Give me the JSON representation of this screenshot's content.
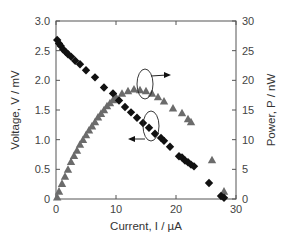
{
  "chart_data": {
    "type": "scatter",
    "title": "",
    "xlabel": "Current, I / µA",
    "ylabel_left": "Voltage, V / mV",
    "ylabel_right": "Power, P / nW",
    "xlim": [
      0,
      30
    ],
    "ylim_left": [
      0,
      3.0
    ],
    "ylim_right": [
      0,
      30
    ],
    "x_ticks": [
      "0",
      "10",
      "20",
      "30"
    ],
    "y_left_ticks": [
      "0",
      "0.5",
      "1.0",
      "1.5",
      "2.0",
      "2.5",
      "3.0"
    ],
    "y_right_ticks": [
      "0",
      "5",
      "10",
      "15",
      "20",
      "25",
      "30"
    ],
    "grid": false,
    "legend": "none (annotated with circles and arrows)",
    "series": [
      {
        "name": "Voltage",
        "axis": "left",
        "marker": "diamond",
        "color": "#111111",
        "x": [
          0.2,
          0.5,
          0.8,
          1.2,
          1.6,
          2.0,
          2.5,
          3.2,
          4.0,
          5.0,
          6.5,
          8.0,
          9.5,
          10.5,
          11.5,
          12.5,
          13.5,
          14.5,
          15.5,
          16.5,
          17.5,
          18.0,
          19.0,
          20.5,
          21.0,
          21.5,
          22.0,
          22.5,
          23.0,
          25.5,
          27.5,
          28.0
        ],
        "y": [
          2.68,
          2.62,
          2.58,
          2.52,
          2.48,
          2.44,
          2.4,
          2.33,
          2.27,
          2.17,
          2.05,
          1.88,
          1.78,
          1.66,
          1.55,
          1.46,
          1.37,
          1.28,
          1.2,
          1.1,
          1.03,
          0.98,
          0.88,
          0.72,
          0.7,
          0.65,
          0.62,
          0.58,
          0.55,
          0.27,
          0.05,
          0.02
        ]
      },
      {
        "name": "Power",
        "axis": "right",
        "marker": "triangle",
        "color": "#6b6b6b",
        "x": [
          0.2,
          0.5,
          1.0,
          1.5,
          2.0,
          2.5,
          3.0,
          3.5,
          4.0,
          4.5,
          5.0,
          5.5,
          6.0,
          6.5,
          7.0,
          7.5,
          8.0,
          8.5,
          9.0,
          9.5,
          10.0,
          11.0,
          12.0,
          13.0,
          14.0,
          15.0,
          16.0,
          17.0,
          18.0,
          19.5,
          21.0,
          22.0,
          22.5,
          26.0,
          28.0
        ],
        "y": [
          0.3,
          1.3,
          2.6,
          3.8,
          5.0,
          6.3,
          7.3,
          8.2,
          9.2,
          10.0,
          10.8,
          11.6,
          12.3,
          13.0,
          13.8,
          14.4,
          15.0,
          15.7,
          16.2,
          16.7,
          17.2,
          17.8,
          18.2,
          18.5,
          18.4,
          18.2,
          17.8,
          17.2,
          16.5,
          15.3,
          14.5,
          13.5,
          13.0,
          6.6,
          1.3
        ]
      }
    ],
    "annotations": [
      {
        "type": "ellipse-with-arrow",
        "target": "Power",
        "arrow_direction": "right",
        "position": {
          "x": 14.5,
          "y_left": 1.95
        }
      },
      {
        "type": "ellipse-with-arrow",
        "target": "Voltage",
        "arrow_direction": "left",
        "position": {
          "x": 15.5,
          "y_left": 1.2
        }
      }
    ]
  }
}
